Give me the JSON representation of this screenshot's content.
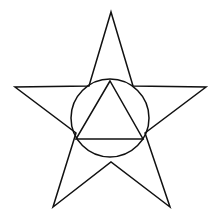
{
  "diagram": {
    "background": "#ffffff",
    "stroke_color": "#111111",
    "stroke_width": 1.5,
    "star": {
      "points": "111,12 133,86 206,87 145,133 170,207 111,162 53,207 76,133 15,87 89,86"
    },
    "circle": {
      "cx": 110,
      "cy": 118,
      "r": 39
    },
    "triangle": {
      "points": "110,81 76,139 143,139"
    }
  }
}
